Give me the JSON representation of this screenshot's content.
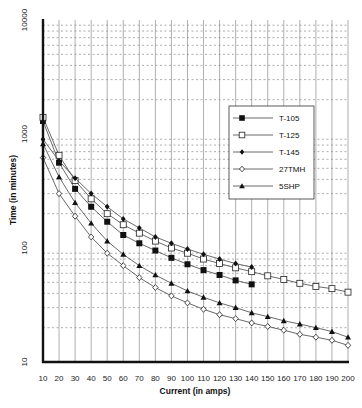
{
  "chart_data": {
    "type": "line",
    "title": "",
    "xlabel": "Current (in amps)",
    "ylabel": "Time (in minutes)",
    "xscale": "linear",
    "yscale": "log",
    "xlim": [
      10,
      200
    ],
    "ylim": [
      10,
      10000
    ],
    "x_ticks": [
      "10",
      "20",
      "30",
      "40",
      "50",
      "60",
      "70",
      "80",
      "90",
      "100",
      "110",
      "120",
      "130",
      "140",
      "150",
      "160",
      "170",
      "180",
      "190",
      "200"
    ],
    "y_ticks": [
      "10",
      "100",
      "1000",
      "10000"
    ],
    "grid": {
      "vertical": "solid",
      "horizontal": "dotted-minor-log"
    },
    "legend": {
      "position": "upper-right-inside",
      "entries": [
        "T-105",
        "T-125",
        "T-145",
        "27TMH",
        "5SHP"
      ]
    },
    "series": [
      {
        "name": "T-105",
        "marker": "filled-square",
        "x": [
          10,
          20,
          30,
          40,
          50,
          60,
          70,
          80,
          90,
          100,
          110,
          120,
          130,
          140
        ],
        "values": [
          1300,
          560,
          330,
          230,
          170,
          130,
          110,
          95,
          82,
          72,
          64,
          58,
          52,
          48
        ]
      },
      {
        "name": "T-125",
        "marker": "open-square",
        "x": [
          10,
          20,
          30,
          40,
          50,
          60,
          70,
          80,
          90,
          100,
          110,
          120,
          130,
          140,
          150,
          160,
          170,
          180,
          190,
          200
        ],
        "values": [
          1400,
          650,
          390,
          270,
          200,
          160,
          135,
          115,
          100,
          90,
          80,
          73,
          67,
          62,
          57,
          53,
          49,
          46,
          44,
          41
        ]
      },
      {
        "name": "T-145",
        "marker": "filled-diamond",
        "x": [
          10,
          20,
          30,
          40,
          50,
          60,
          70,
          80,
          90,
          100,
          110,
          120,
          130,
          140
        ],
        "values": [
          900,
          580,
          410,
          300,
          230,
          180,
          150,
          125,
          110,
          98,
          88,
          80,
          73,
          68
        ]
      },
      {
        "name": "27TMH",
        "marker": "open-diamond",
        "x": [
          10,
          20,
          30,
          40,
          50,
          60,
          70,
          80,
          90,
          100,
          110,
          120,
          130,
          140,
          150,
          160,
          170,
          180,
          190,
          200
        ],
        "values": [
          620,
          300,
          190,
          125,
          90,
          70,
          55,
          45,
          38,
          33,
          29,
          26,
          24,
          22,
          20.5,
          19,
          17.5,
          16.5,
          15.5,
          14
        ]
      },
      {
        "name": "5SHP",
        "marker": "filled-triangle",
        "x": [
          10,
          20,
          30,
          40,
          50,
          60,
          70,
          80,
          90,
          100,
          110,
          120,
          130,
          140,
          150,
          160,
          170,
          180,
          190,
          200
        ],
        "values": [
          820,
          420,
          250,
          165,
          115,
          88,
          70,
          58,
          49,
          42,
          37,
          33,
          30,
          27,
          25,
          23,
          21.5,
          20,
          18.5,
          16.5
        ]
      }
    ]
  },
  "axes": {
    "x_label": "Current (in amps)",
    "y_label": "Time (in minutes)"
  },
  "legend": {
    "items": [
      {
        "label": "T-105",
        "marker": "filled-square"
      },
      {
        "label": "T-125",
        "marker": "open-square"
      },
      {
        "label": "T-145",
        "marker": "filled-diamond"
      },
      {
        "label": "27TMH",
        "marker": "open-diamond"
      },
      {
        "label": "5SHP",
        "marker": "filled-triangle"
      }
    ]
  }
}
